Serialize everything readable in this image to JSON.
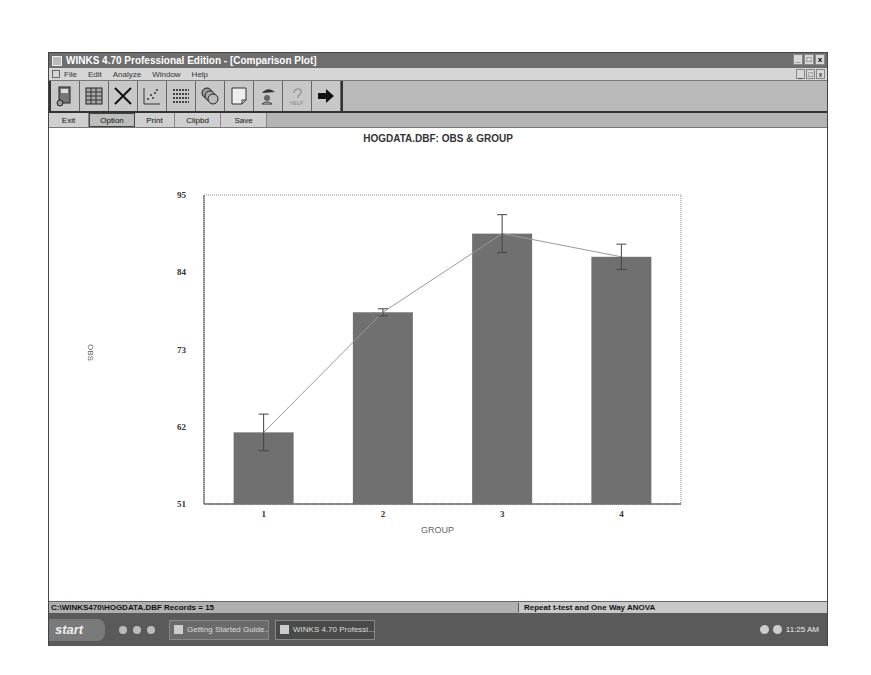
{
  "window": {
    "title": "WINKS 4.70 Professional Edition - [Comparison Plot]",
    "controls": [
      "_",
      "□",
      "x"
    ]
  },
  "menu": {
    "items": [
      "File",
      "Edit",
      "Analyze",
      "Window",
      "Help"
    ],
    "controls": [
      "_",
      "□",
      "x"
    ]
  },
  "toolbar": {
    "icons": [
      "data-disk-icon",
      "spreadsheet-icon",
      "close-x-icon",
      "scatter-plot-icon",
      "list-icon",
      "coins-icon",
      "note-icon",
      "wizard-icon",
      "help-icon",
      "exit-arrow-icon"
    ]
  },
  "buttons": {
    "exit": "Exit",
    "option": "Option",
    "print": "Print",
    "clipbd": "Clipbd",
    "save": "Save"
  },
  "chart": {
    "title": "HOGDATA.DBF: OBS & GROUP"
  },
  "chart_data": {
    "type": "bar",
    "title": "HOGDATA.DBF: OBS & GROUP",
    "xlabel": "GROUP",
    "ylabel": "OBS",
    "categories": [
      "1",
      "2",
      "3",
      "4"
    ],
    "values": [
      61.2,
      78.3,
      89.5,
      86.2
    ],
    "error": [
      2.6,
      0.5,
      2.7,
      1.8
    ],
    "overlay_line": true,
    "yticks": [
      51,
      62,
      73,
      84,
      95
    ],
    "ylim": [
      51,
      95
    ],
    "grid": false,
    "legend": null,
    "bar_color": "#707070"
  },
  "status": {
    "left": "C:\\WINKS470\\HOGDATA.DBF Records = 15",
    "right": "Repeat t-test and One Way ANOVA"
  },
  "taskbar": {
    "start": "start",
    "items": [
      "Getting Started Guide...",
      "WINKS 4.70 Professi..."
    ],
    "clock": "11:25 AM"
  }
}
